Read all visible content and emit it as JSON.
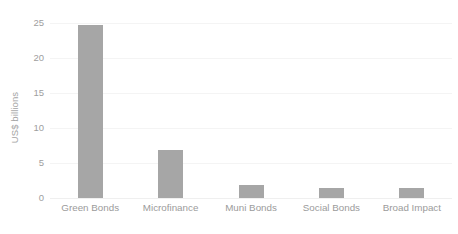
{
  "chart_data": {
    "type": "bar",
    "title": "",
    "subtitle": "",
    "xlabel": "",
    "ylabel": "US$ billions",
    "categories": [
      "Green Bonds",
      "Microfinance",
      "Muni Bonds",
      "Social Bonds",
      "Broad Impact"
    ],
    "values": [
      24.7,
      6.8,
      1.9,
      1.4,
      1.4
    ],
    "ylim": [
      0,
      25
    ],
    "yticks": [
      0,
      5,
      10,
      15,
      20,
      25
    ],
    "ytick_labels": [
      "0",
      "5",
      "10",
      "15",
      "20",
      "25"
    ],
    "grid": true,
    "grid_axis": "y",
    "legend": false,
    "legend_position": "none",
    "bar_color": "#a6a6a6",
    "gridline_color": "#f4f4f4",
    "tick_label_color": "#9e9e9e",
    "axis_title_color": "#a3a3a3",
    "background_color": "#ffffff"
  }
}
